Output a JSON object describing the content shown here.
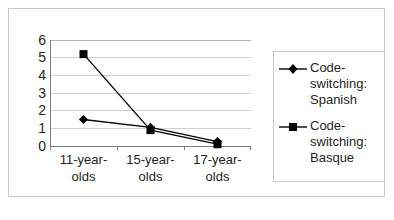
{
  "chart_data": {
    "type": "line",
    "title": "",
    "xlabel": "",
    "ylabel": "",
    "ylim": [
      0,
      6
    ],
    "yticks": [
      "0",
      "1",
      "2",
      "3",
      "4",
      "5",
      "6"
    ],
    "grid": true,
    "legend_position": "right",
    "categories": [
      "11-year-olds",
      "15-year-olds",
      "17-year-olds"
    ],
    "series": [
      {
        "name": "Code-switching: Spanish",
        "marker": "diamond",
        "color": "#000000",
        "values": [
          1.5,
          1.05,
          0.25
        ]
      },
      {
        "name": "Code-switching: Basque",
        "marker": "square",
        "color": "#000000",
        "values": [
          5.2,
          0.9,
          0.1
        ]
      }
    ]
  },
  "colors": {
    "frame": "#c8c8c8",
    "gridline": "#d0d0d0",
    "axis": "#808080",
    "text": "#231f20",
    "series": "#000000"
  }
}
